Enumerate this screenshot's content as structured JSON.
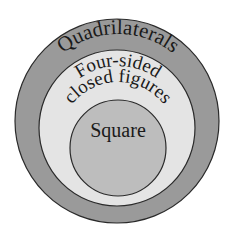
{
  "diagram": {
    "type": "nested-venn",
    "colors": {
      "background": "#ffffff",
      "outer_fill": "#9a9a9a",
      "middle_fill": "#e4e4e4",
      "inner_fill": "#bdbdbd",
      "stroke": "#2a2a2a"
    },
    "circles": [
      {
        "id": "outer",
        "label": "Quadrilaterals"
      },
      {
        "id": "middle",
        "label_line1": "Four-sided",
        "label_line2": "closed figures"
      },
      {
        "id": "inner",
        "label": "Square"
      }
    ]
  }
}
